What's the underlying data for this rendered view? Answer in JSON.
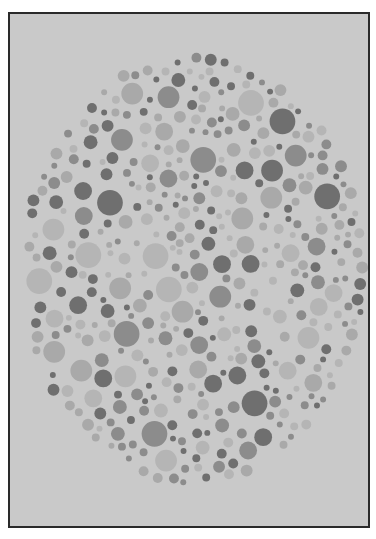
{
  "plate": {
    "kind": "color-vision-test-plate",
    "background": "#c9c9c9",
    "border": "#2a2a2a",
    "circle": {
      "cx": 186,
      "cy": 258,
      "rx": 172,
      "ry": 216
    },
    "palette": {
      "dark": "#6f6f6f",
      "mid": "#8c8c8c",
      "light": "#a9a9a9",
      "pale": "#b5b5b5"
    }
  }
}
